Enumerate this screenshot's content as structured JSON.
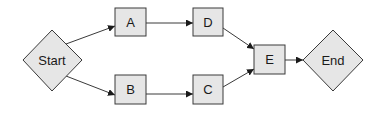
{
  "diagram": {
    "type": "flowchart",
    "colors": {
      "node_fill": "#e6e6e6",
      "node_stroke": "#3a3a3a",
      "edge": "#3a3a3a",
      "text": "#1a1a1a"
    },
    "nodes": [
      {
        "id": "start",
        "label": "Start",
        "shape": "diamond"
      },
      {
        "id": "a",
        "label": "A",
        "shape": "box"
      },
      {
        "id": "b",
        "label": "B",
        "shape": "box"
      },
      {
        "id": "d",
        "label": "D",
        "shape": "box"
      },
      {
        "id": "c",
        "label": "C",
        "shape": "box"
      },
      {
        "id": "e",
        "label": "E",
        "shape": "box"
      },
      {
        "id": "end",
        "label": "End",
        "shape": "diamond"
      }
    ],
    "edges": [
      {
        "from": "Start",
        "to": "A"
      },
      {
        "from": "Start",
        "to": "B"
      },
      {
        "from": "A",
        "to": "D"
      },
      {
        "from": "B",
        "to": "C"
      },
      {
        "from": "D",
        "to": "E"
      },
      {
        "from": "C",
        "to": "E"
      },
      {
        "from": "E",
        "to": "End"
      }
    ]
  }
}
